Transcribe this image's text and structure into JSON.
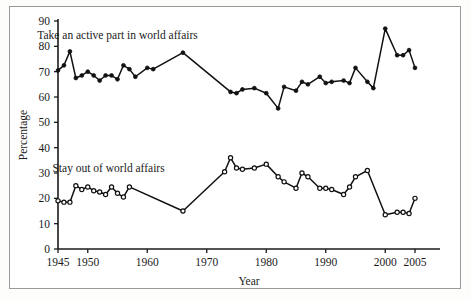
{
  "chart_data": {
    "type": "line",
    "title": "",
    "xlabel": "Year",
    "ylabel": "Percentage",
    "xlim": [
      1945,
      2006
    ],
    "ylim": [
      0,
      90
    ],
    "grid": false,
    "legend_position": "inline-annotation",
    "xticks": [
      1945,
      1950,
      1960,
      1970,
      1980,
      1990,
      2000,
      2005
    ],
    "xtick_labels": [
      "1945",
      "1950",
      "1960",
      "1970",
      "1980",
      "1990",
      "2000",
      "2005"
    ],
    "yticks": [
      0,
      10,
      20,
      30,
      40,
      50,
      60,
      70,
      80,
      90
    ],
    "ytick_labels": [
      "0",
      "10",
      "20",
      "30",
      "40",
      "50",
      "60",
      "70",
      "80",
      "90"
    ],
    "series": [
      {
        "name": "Take an active part in world affairs",
        "marker": "filled-circle",
        "label_x": 1955.0,
        "label_y": 83.0,
        "points": [
          [
            1945,
            70.5
          ],
          [
            1946,
            72.5
          ],
          [
            1947,
            78.0
          ],
          [
            1948,
            67.5
          ],
          [
            1949,
            68.5
          ],
          [
            1950,
            70.0
          ],
          [
            1951,
            68.5
          ],
          [
            1952,
            66.5
          ],
          [
            1953,
            68.5
          ],
          [
            1954,
            68.5
          ],
          [
            1955,
            67.0
          ],
          [
            1956,
            72.5
          ],
          [
            1957,
            71.0
          ],
          [
            1958,
            68.0
          ],
          [
            1960,
            71.5
          ],
          [
            1961,
            71.0
          ],
          [
            1966,
            77.5
          ],
          [
            1974,
            62.0
          ],
          [
            1975,
            61.5
          ],
          [
            1976,
            63.0
          ],
          [
            1978,
            63.5
          ],
          [
            1980,
            61.5
          ],
          [
            1982,
            55.5
          ],
          [
            1983,
            64.0
          ],
          [
            1985,
            62.5
          ],
          [
            1986,
            66.0
          ],
          [
            1987,
            65.0
          ],
          [
            1989,
            68.0
          ],
          [
            1990,
            65.5
          ],
          [
            1991,
            66.0
          ],
          [
            1993,
            66.5
          ],
          [
            1994,
            65.5
          ],
          [
            1995,
            71.5
          ],
          [
            1997,
            66.0
          ],
          [
            1998,
            63.5
          ],
          [
            2000,
            87.0
          ],
          [
            2002,
            76.5
          ],
          [
            2003,
            76.5
          ],
          [
            2004,
            78.5
          ],
          [
            2005,
            71.5
          ]
        ]
      },
      {
        "name": "Stay out of world affairs",
        "marker": "open-circle",
        "label_x": 1953.5,
        "label_y": 30.5,
        "points": [
          [
            1945,
            19.0
          ],
          [
            1946,
            18.5
          ],
          [
            1947,
            18.5
          ],
          [
            1948,
            25.0
          ],
          [
            1949,
            23.5
          ],
          [
            1950,
            24.5
          ],
          [
            1951,
            23.0
          ],
          [
            1952,
            22.5
          ],
          [
            1953,
            21.5
          ],
          [
            1954,
            24.5
          ],
          [
            1955,
            22.0
          ],
          [
            1956,
            20.5
          ],
          [
            1957,
            24.5
          ],
          [
            1966,
            15.0
          ],
          [
            1973,
            30.5
          ],
          [
            1974,
            36.0
          ],
          [
            1975,
            32.0
          ],
          [
            1976,
            31.5
          ],
          [
            1978,
            32.0
          ],
          [
            1980,
            33.5
          ],
          [
            1982,
            28.5
          ],
          [
            1983,
            26.5
          ],
          [
            1985,
            24.0
          ],
          [
            1986,
            30.0
          ],
          [
            1987,
            28.5
          ],
          [
            1989,
            24.0
          ],
          [
            1990,
            24.0
          ],
          [
            1991,
            23.5
          ],
          [
            1993,
            21.5
          ],
          [
            1994,
            24.5
          ],
          [
            1995,
            28.5
          ],
          [
            1997,
            31.0
          ],
          [
            2000,
            13.5
          ],
          [
            2002,
            14.5
          ],
          [
            2003,
            14.5
          ],
          [
            2004,
            14.0
          ],
          [
            2005,
            20.0
          ]
        ]
      }
    ]
  }
}
